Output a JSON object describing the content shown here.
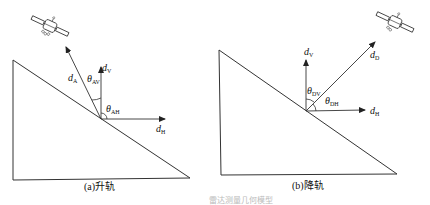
{
  "panels": [
    {
      "id": "a",
      "caption": "(a)升轨",
      "vectors": {
        "look": {
          "sym": "d",
          "sub": "A"
        },
        "vertical": {
          "sym": "d",
          "sub": "V"
        },
        "horizontal": {
          "sym": "d",
          "sub": "H"
        }
      },
      "angles": [
        {
          "sym": "θ",
          "sub": "AV"
        },
        {
          "sym": "θ",
          "sub": "AH"
        }
      ]
    },
    {
      "id": "b",
      "caption": "(b)降轨",
      "vectors": {
        "look": {
          "sym": "d",
          "sub": "D"
        },
        "vertical": {
          "sym": "d",
          "sub": "V"
        },
        "horizontal": {
          "sym": "d",
          "sub": "H"
        }
      },
      "angles": [
        {
          "sym": "θ",
          "sub": "DV"
        },
        {
          "sym": "θ",
          "sub": "DH"
        }
      ]
    }
  ],
  "figure_caption": "雷达测量几何模型"
}
